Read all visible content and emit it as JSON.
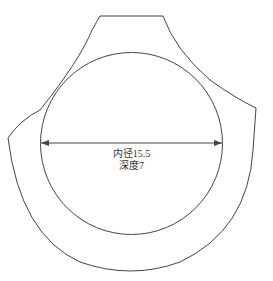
{
  "diagram": {
    "inner_diameter_label": "内径15.5",
    "depth_label": "深度7",
    "line_color": "#444444",
    "shapes": [
      "outer-outline",
      "inner-circle",
      "diameter-dimension-arrow"
    ]
  }
}
